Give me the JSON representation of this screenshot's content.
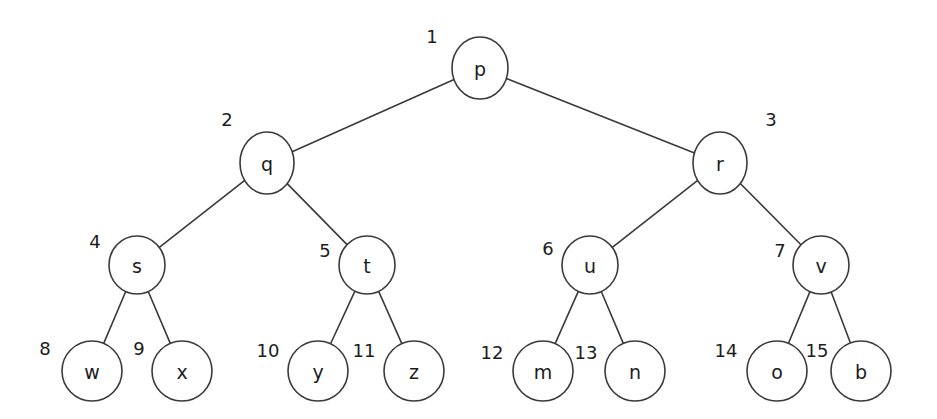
{
  "figure": {
    "background_color": "#ffffff",
    "stroke_color": "#3a3a3a",
    "text_color": "#1c1c1c",
    "width": 937,
    "height": 419
  },
  "diagram": {
    "type": "binary-tree",
    "node_radius_default": 29,
    "nodes": [
      {
        "id": "p",
        "label": "p",
        "index": "1",
        "cx": 480,
        "cy": 68,
        "rx": 28,
        "ry": 31,
        "index_x": 432,
        "index_y": 36
      },
      {
        "id": "q",
        "label": "q",
        "index": "2",
        "cx": 267,
        "cy": 163,
        "rx": 27,
        "ry": 31,
        "index_x": 227,
        "index_y": 119
      },
      {
        "id": "r",
        "label": "r",
        "index": "3",
        "cx": 720,
        "cy": 163,
        "rx": 27,
        "ry": 31,
        "index_x": 771,
        "index_y": 119
      },
      {
        "id": "s",
        "label": "s",
        "index": "4",
        "cx": 137,
        "cy": 265,
        "rx": 28,
        "ry": 29,
        "index_x": 95,
        "index_y": 241
      },
      {
        "id": "t",
        "label": "t",
        "index": "5",
        "cx": 367,
        "cy": 265,
        "rx": 28,
        "ry": 29,
        "index_x": 325,
        "index_y": 250
      },
      {
        "id": "u",
        "label": "u",
        "index": "6",
        "cx": 590,
        "cy": 265,
        "rx": 28,
        "ry": 29,
        "index_x": 548,
        "index_y": 248
      },
      {
        "id": "v",
        "label": "v",
        "index": "7",
        "cx": 821,
        "cy": 265,
        "rx": 28,
        "ry": 29,
        "index_x": 780,
        "index_y": 250
      },
      {
        "id": "w",
        "label": "w",
        "index": "8",
        "cx": 92,
        "cy": 371,
        "rx": 30,
        "ry": 30,
        "index_x": 45,
        "index_y": 348
      },
      {
        "id": "x",
        "label": "x",
        "index": "9",
        "cx": 182,
        "cy": 371,
        "rx": 30,
        "ry": 30,
        "index_x": 139,
        "index_y": 348
      },
      {
        "id": "y",
        "label": "y",
        "index": "10",
        "cx": 318,
        "cy": 371,
        "rx": 30,
        "ry": 30,
        "index_x": 268,
        "index_y": 350
      },
      {
        "id": "z",
        "label": "z",
        "index": "11",
        "cx": 414,
        "cy": 371,
        "rx": 30,
        "ry": 30,
        "index_x": 364,
        "index_y": 350
      },
      {
        "id": "m",
        "label": "m",
        "index": "12",
        "cx": 543,
        "cy": 371,
        "rx": 30,
        "ry": 30,
        "index_x": 492,
        "index_y": 352
      },
      {
        "id": "n",
        "label": "n",
        "index": "13",
        "cx": 635,
        "cy": 371,
        "rx": 30,
        "ry": 30,
        "index_x": 586,
        "index_y": 352
      },
      {
        "id": "o",
        "label": "o",
        "index": "14",
        "cx": 777,
        "cy": 371,
        "rx": 30,
        "ry": 30,
        "index_x": 726,
        "index_y": 350
      },
      {
        "id": "b",
        "label": "b",
        "index": "15",
        "cx": 861,
        "cy": 371,
        "rx": 30,
        "ry": 30,
        "index_x": 817,
        "index_y": 350
      }
    ],
    "edges": [
      {
        "from": "p",
        "to": "q"
      },
      {
        "from": "p",
        "to": "r"
      },
      {
        "from": "q",
        "to": "s"
      },
      {
        "from": "q",
        "to": "t"
      },
      {
        "from": "r",
        "to": "u"
      },
      {
        "from": "r",
        "to": "v"
      },
      {
        "from": "s",
        "to": "w"
      },
      {
        "from": "s",
        "to": "x"
      },
      {
        "from": "t",
        "to": "y"
      },
      {
        "from": "t",
        "to": "z"
      },
      {
        "from": "u",
        "to": "m"
      },
      {
        "from": "u",
        "to": "n"
      },
      {
        "from": "v",
        "to": "o"
      },
      {
        "from": "v",
        "to": "b"
      }
    ]
  }
}
